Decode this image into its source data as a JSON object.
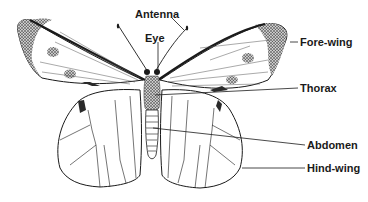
{
  "diagram": {
    "labels": {
      "antenna": "Antenna",
      "eye": "Eye",
      "fore_wing": "Fore-wing",
      "thorax": "Thorax",
      "abdomen": "Abdomen",
      "hind_wing": "Hind-wing"
    },
    "colors": {
      "ink": "#1a1a1a",
      "stipple": "#3a3a3a",
      "background": "#ffffff"
    }
  }
}
